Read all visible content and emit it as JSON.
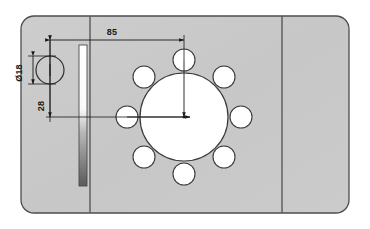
{
  "drawing": {
    "title": "Mounting plate bolt-circle detail",
    "units": "mm",
    "background_color": "#ffffff",
    "plate": {
      "name": "mounting-plate",
      "fill_color": "#c9c9c9",
      "edge_color": "#4d4d4d",
      "x": 21,
      "y": 16,
      "width": 328,
      "height": 197,
      "corner_radius": 13
    },
    "fold_lines": [
      {
        "name": "left-fold-line",
        "x": 90,
        "color": "#3a3a3a"
      },
      {
        "name": "right-fold-line",
        "x": 282,
        "color": "#3a3a3a"
      }
    ],
    "slot": {
      "name": "vertical-slot",
      "x": 79,
      "y": 45,
      "width": 8,
      "height": 141,
      "top_color": "#ffffff",
      "bottom_color": "#5a5a5a",
      "edge_color": "#4d4d4d"
    },
    "center_bore": {
      "name": "center-bore",
      "cx": 184,
      "cy": 117,
      "r": 44,
      "fill_color": "#ffffff",
      "edge_color": "#3a3a3a"
    },
    "bolt_circle": {
      "name": "bolt-circle",
      "cx": 184,
      "cy": 117,
      "radius": 57,
      "hole_count": 8,
      "hole_radius": 11,
      "start_angle_deg": -90,
      "fill_color": "#ffffff",
      "edge_color": "#3a3a3a",
      "holes": [
        {
          "name": "bolt-hole-1",
          "cx": 184,
          "cy": 60
        },
        {
          "name": "bolt-hole-2",
          "cx": 224,
          "cy": 77
        },
        {
          "name": "bolt-hole-3",
          "cx": 241,
          "cy": 117
        },
        {
          "name": "bolt-hole-4",
          "cx": 224,
          "cy": 157
        },
        {
          "name": "bolt-hole-5",
          "cx": 184,
          "cy": 174
        },
        {
          "name": "bolt-hole-6",
          "cx": 144,
          "cy": 157
        },
        {
          "name": "bolt-hole-7",
          "cx": 127,
          "cy": 117
        },
        {
          "name": "bolt-hole-8",
          "cx": 144,
          "cy": 77
        }
      ]
    },
    "pilot_hole": {
      "name": "pilot-hole",
      "cx": 50,
      "cy": 70,
      "r": 14,
      "fill_color": "#c9c9c9",
      "edge_color": "#2e2e2e"
    },
    "dimensions": [
      {
        "name": "dimension-85-horizontal",
        "label": "85",
        "value": 85,
        "orientation": "horizontal",
        "from_x": 50,
        "to_x": 184,
        "line_y": 40,
        "label_x": 112,
        "label_y": 34,
        "color": "#1a1a1a"
      },
      {
        "name": "dimension-28-vertical",
        "label": "28",
        "value": 28,
        "orientation": "vertical",
        "line_x": 50,
        "from_y": 40,
        "to_y": 117,
        "label_x": 44,
        "label_y": 106,
        "color": "#1a1a1a"
      },
      {
        "name": "dimension-diameter-pilot",
        "label": "Ø18",
        "value": 18,
        "orientation": "vertical-diameter",
        "line_x": 32,
        "from_y": 56,
        "to_y": 84,
        "label_x": 24,
        "label_y": 78,
        "color": "#1a1a1a"
      }
    ],
    "center_marks": [
      {
        "name": "center-mark-vertical",
        "x1": 184,
        "y1": 60,
        "x2": 184,
        "y2": 117
      },
      {
        "name": "center-mark-horizontal",
        "x1": 127,
        "y1": 117,
        "x2": 184,
        "y2": 117
      }
    ]
  }
}
